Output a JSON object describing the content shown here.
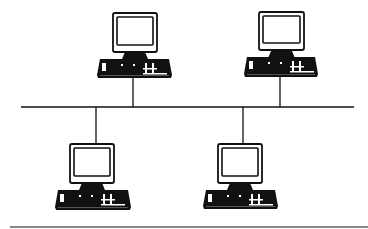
{
  "diagram": {
    "type": "bus-network-topology",
    "title": "",
    "colors": {
      "line": "#111111",
      "background": "#ffffff",
      "rule": "#888888"
    },
    "bus": {
      "x1": 21,
      "x2": 354,
      "y": 107
    },
    "nodes": [
      {
        "id": "workstation-1",
        "label": "",
        "position": "top",
        "monitor": {
          "x": 113,
          "y": 13,
          "w": 44,
          "h": 39
        },
        "keyboard": {
          "x": 97,
          "y": 59,
          "w": 75,
          "h": 19
        },
        "drop_x": 133
      },
      {
        "id": "workstation-2",
        "label": "",
        "position": "top",
        "monitor": {
          "x": 259,
          "y": 12,
          "w": 45,
          "h": 38
        },
        "keyboard": {
          "x": 244,
          "y": 57,
          "w": 74,
          "h": 20
        },
        "drop_x": 280
      },
      {
        "id": "workstation-3",
        "label": "",
        "position": "bottom",
        "monitor": {
          "x": 70,
          "y": 144,
          "w": 44,
          "h": 39
        },
        "keyboard": {
          "x": 55,
          "y": 190,
          "w": 76,
          "h": 20
        },
        "drop_x": 96
      },
      {
        "id": "workstation-4",
        "label": "",
        "position": "bottom",
        "monitor": {
          "x": 218,
          "y": 144,
          "w": 44,
          "h": 39
        },
        "keyboard": {
          "x": 203,
          "y": 190,
          "w": 75,
          "h": 19
        },
        "drop_x": 243
      }
    ],
    "bottom_rule": {
      "y": 227,
      "x1": 10,
      "x2": 368
    }
  }
}
